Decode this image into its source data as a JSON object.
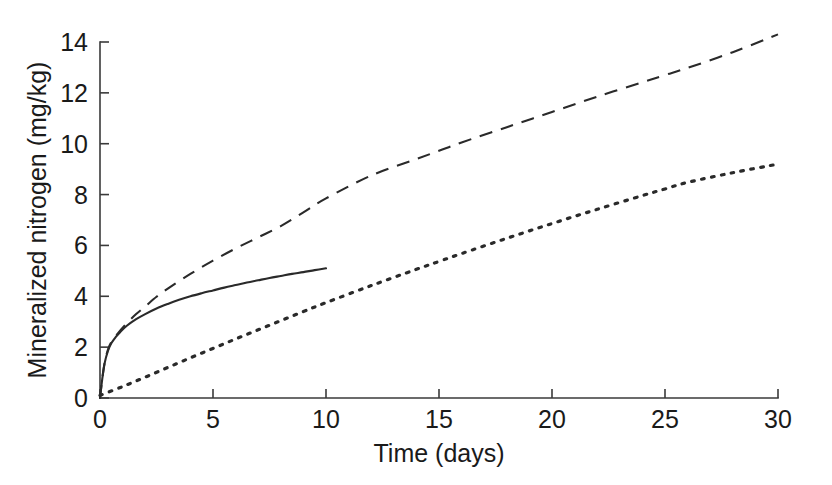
{
  "chart_data": {
    "type": "line",
    "title": "",
    "xlabel": "Time (days)",
    "ylabel": "Mineralized nitrogen (mg/kg)",
    "xlim": [
      0,
      30
    ],
    "ylim": [
      0,
      14
    ],
    "xticks": [
      0,
      5,
      10,
      15,
      20,
      25,
      30
    ],
    "yticks": [
      0,
      2,
      4,
      6,
      8,
      10,
      12,
      14
    ],
    "xticklabels": [
      "0",
      "5",
      "10",
      "15",
      "20",
      "25",
      "30"
    ],
    "yticklabels": [
      "0",
      "2",
      "4",
      "6",
      "8",
      "10",
      "12",
      "14"
    ],
    "grid": false,
    "legend": "none",
    "line_color": "#2a2a2a",
    "axis_color": "#3a3a3a",
    "background": "#ffffff",
    "series": [
      {
        "name": "solid-curve",
        "style": "solid",
        "x": [
          0,
          0.1,
          0.2,
          0.35,
          0.5,
          0.7,
          0.9,
          1.2,
          1.6,
          2.0,
          2.5,
          3.0,
          3.5,
          4.0,
          4.5,
          5.0,
          5.5,
          6.0,
          6.5,
          7.0,
          7.5,
          8.0,
          8.5,
          9.0,
          9.5,
          10.0
        ],
        "y": [
          0.0,
          0.75,
          1.35,
          1.85,
          2.15,
          2.4,
          2.6,
          2.85,
          3.1,
          3.3,
          3.52,
          3.7,
          3.86,
          4.0,
          4.12,
          4.23,
          4.34,
          4.44,
          4.54,
          4.63,
          4.72,
          4.8,
          4.88,
          4.95,
          5.03,
          5.1
        ]
      },
      {
        "name": "dashed-curve",
        "style": "dashed",
        "x": [
          0,
          0.1,
          0.2,
          0.35,
          0.5,
          0.8,
          1.2,
          1.6,
          2.0,
          2.5,
          3.0,
          4.0,
          5.0,
          6.0,
          7.0,
          8.0,
          9.0,
          10.0,
          12.0,
          14.0,
          15.0,
          16.0,
          18.0,
          20.0,
          22.0,
          24.0,
          25.0,
          26.0,
          28.0,
          30.0
        ],
        "y": [
          0.0,
          0.75,
          1.35,
          1.9,
          2.2,
          2.55,
          2.95,
          3.3,
          3.6,
          3.98,
          4.3,
          4.88,
          5.4,
          5.88,
          6.32,
          6.76,
          7.3,
          7.85,
          8.75,
          9.4,
          9.72,
          10.05,
          10.65,
          11.25,
          11.85,
          12.42,
          12.7,
          12.98,
          13.6,
          14.3
        ]
      },
      {
        "name": "dotted-curve",
        "style": "dotted",
        "x": [
          0,
          1,
          2,
          3,
          4,
          5,
          6,
          7,
          8,
          9,
          10,
          12,
          14,
          15,
          16,
          18,
          20,
          22,
          24,
          25,
          26,
          28,
          30
        ],
        "y": [
          0.1,
          0.45,
          0.82,
          1.2,
          1.58,
          1.95,
          2.32,
          2.68,
          3.04,
          3.4,
          3.75,
          4.42,
          5.06,
          5.37,
          5.68,
          6.28,
          6.86,
          7.42,
          7.96,
          8.22,
          8.48,
          8.86,
          9.2
        ]
      }
    ]
  }
}
